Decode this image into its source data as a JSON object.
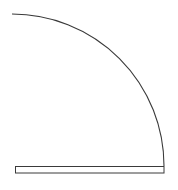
{
  "diagram": {
    "type": "door-swing-symbol",
    "stroke_color": "#3a3a3a",
    "background": "#ffffff",
    "arc": {
      "cx": 12,
      "cy": 166,
      "r": 152,
      "start": [
        12,
        14
      ],
      "end": [
        164,
        166
      ]
    },
    "door_leaf": {
      "x": 15,
      "y": 166,
      "width": 149,
      "height": 7
    }
  }
}
